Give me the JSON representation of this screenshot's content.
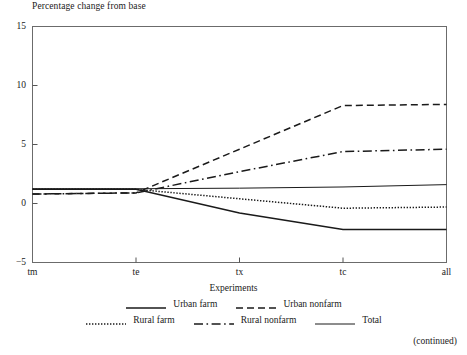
{
  "figure": {
    "title": "Percentage change from base",
    "continued_note": "(continued)"
  },
  "chart_data": {
    "type": "line",
    "title": "Percentage change from base",
    "subtitle": "",
    "xlabel": "Experiments",
    "ylabel": "Percentage change from base",
    "categories": [
      "tm",
      "te",
      "tx",
      "tc",
      "all"
    ],
    "x_tick_labels": [
      "tm",
      "te",
      "tx",
      "tc",
      "all"
    ],
    "y_tick_labels": [
      "-5",
      "0",
      "5",
      "10",
      "15"
    ],
    "y_ticks": [
      -5,
      0,
      5,
      10,
      15
    ],
    "ylim": [
      -5,
      15
    ],
    "xlim": [
      0,
      4
    ],
    "grid": false,
    "legend_position": "below",
    "series": [
      {
        "name": "Urban farm",
        "style": "solid-thick",
        "values": [
          1.2,
          1.2,
          -0.8,
          -2.2,
          -2.2
        ]
      },
      {
        "name": "Urban nonfarm",
        "style": "dashed",
        "values": [
          0.8,
          0.9,
          4.6,
          8.3,
          8.4
        ]
      },
      {
        "name": "Rural farm",
        "style": "dotted",
        "values": [
          1.2,
          1.2,
          0.4,
          -0.4,
          -0.3
        ]
      },
      {
        "name": "Rural nonfarm",
        "style": "dashdot",
        "values": [
          0.8,
          0.9,
          2.7,
          4.4,
          4.6
        ]
      },
      {
        "name": "Total",
        "style": "solid-thin",
        "values": [
          1.25,
          1.25,
          1.3,
          1.4,
          1.6
        ]
      }
    ],
    "legend_entries": [
      {
        "label": "Urban farm",
        "style": "solid-thick"
      },
      {
        "label": "Urban nonfarm",
        "style": "dashed"
      },
      {
        "label": "Rural farm",
        "style": "dotted"
      },
      {
        "label": "Rural nonfarm",
        "style": "dashdot"
      },
      {
        "label": "Total",
        "style": "solid-thin"
      }
    ],
    "colors": {
      "line": "#1a1a1a",
      "axis": "#555555",
      "background": "#ffffff"
    }
  }
}
